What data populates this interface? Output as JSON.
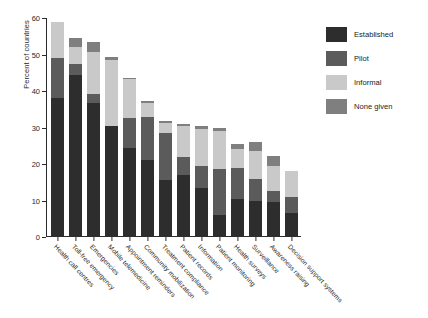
{
  "chart_data": {
    "type": "bar",
    "stacked": true,
    "title": "",
    "xlabel": "",
    "ylabel": "Percent of countries",
    "ylim": [
      0,
      60
    ],
    "yticks": [
      0,
      10,
      20,
      30,
      40,
      50,
      60
    ],
    "grid": false,
    "legend_position": "right",
    "categories": [
      "Health call centres",
      "Toll-free emergency",
      "Emergencies",
      "Mobile telemedicine",
      "Appointment reminders",
      "Community mobilization",
      "Treatment compliance",
      "Patient records",
      "Information",
      "Patient monitoring",
      "Health surveys",
      "Surveillance",
      "Awareness raising",
      "Decision support systems"
    ],
    "series": [
      {
        "name": "Established",
        "color": "#2d2d2d",
        "values": [
          38.0,
          44.5,
          36.8,
          30.3,
          24.5,
          21.0,
          15.5,
          17.0,
          13.5,
          6.0,
          10.5,
          10.0,
          9.5,
          6.5
        ]
      },
      {
        "name": "Pilot",
        "color": "#5b5b5b",
        "values": [
          11.0,
          3.0,
          2.5,
          0.0,
          8.2,
          11.8,
          13.0,
          5.0,
          6.0,
          12.5,
          8.5,
          6.0,
          3.0,
          4.5
        ]
      },
      {
        "name": "Informal",
        "color": "#c9c9c9",
        "values": [
          10.0,
          4.5,
          11.5,
          18.3,
          10.5,
          3.8,
          2.8,
          8.5,
          10.0,
          10.5,
          5.0,
          7.5,
          7.0,
          7.0
        ]
      },
      {
        "name": "None given",
        "color": "#7f7f7f",
        "values": [
          0.0,
          2.5,
          2.7,
          0.8,
          0.5,
          0.6,
          0.5,
          0.5,
          1.0,
          0.8,
          1.5,
          2.5,
          2.7,
          0.0
        ]
      }
    ],
    "totals": [
      59.0,
      54.5,
      53.5,
      49.4,
      43.7,
      37.2,
      31.8,
      31.0,
      30.5,
      29.8,
      25.5,
      26.0,
      22.2,
      18.0
    ]
  },
  "legend": {
    "items": [
      {
        "label": "Established"
      },
      {
        "label": "Pilot"
      },
      {
        "label": "Informal"
      },
      {
        "label": "None given"
      }
    ]
  }
}
